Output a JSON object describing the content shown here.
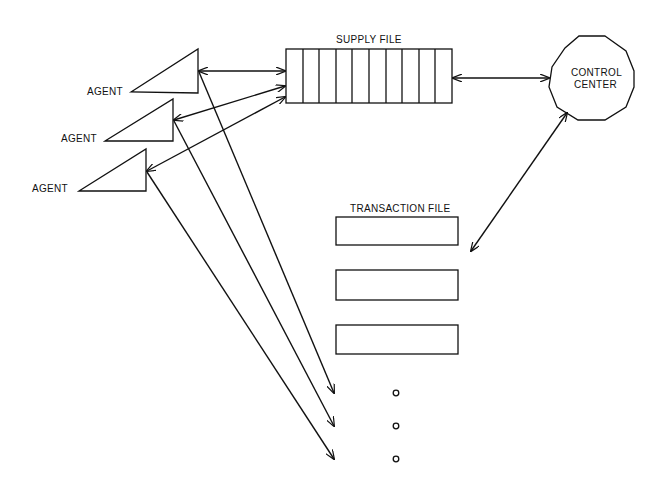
{
  "diagram": {
    "colors": {
      "ink": "#111111",
      "background": "#ffffff"
    },
    "agents": [
      {
        "label": "AGENT",
        "label_pos": [
          87,
          95
        ],
        "triangle": [
          [
            131,
            92
          ],
          [
            198,
            49
          ],
          [
            198,
            93
          ]
        ]
      },
      {
        "label": "AGENT",
        "label_pos": [
          61,
          142
        ],
        "triangle": [
          [
            105,
            141
          ],
          [
            173,
            99
          ],
          [
            173,
            141
          ]
        ]
      },
      {
        "label": "AGENT",
        "label_pos": [
          32,
          192
        ],
        "triangle": [
          [
            79,
            191
          ],
          [
            146,
            149
          ],
          [
            146,
            191
          ]
        ]
      }
    ],
    "supply_file": {
      "label": "SUPPLY FILE",
      "x": 286,
      "y": 49,
      "width": 166,
      "height": 54,
      "cells": 10
    },
    "control_center": {
      "label_line1": "CONTROL",
      "label_line2": "CENTER",
      "cx": 592,
      "cy": 78,
      "r": 43,
      "sides": 10
    },
    "transaction_file": {
      "label": "TRANSACTION FILE",
      "boxes": [
        {
          "x": 336,
          "y": 217,
          "width": 122,
          "height": 28
        },
        {
          "x": 336,
          "y": 270,
          "width": 122,
          "height": 30
        },
        {
          "x": 336,
          "y": 325,
          "width": 122,
          "height": 29
        }
      ],
      "continuation_dots": [
        [
          396,
          393
        ],
        [
          396,
          426
        ],
        [
          396,
          459
        ]
      ]
    }
  }
}
